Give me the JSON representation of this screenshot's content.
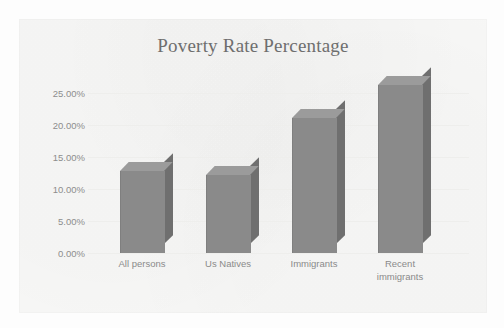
{
  "chart_data": {
    "type": "bar",
    "title": "Poverty Rate Percentage",
    "xlabel": "",
    "ylabel": "",
    "categories": [
      "All persons",
      "Us Natives",
      "Immigrants",
      "Recent immigrants"
    ],
    "values": [
      11.4,
      10.8,
      18.8,
      23.4
    ],
    "value_labels": [
      "11.40%",
      "10.80%",
      "18.80%",
      "23.40%"
    ],
    "ylim": [
      0,
      25
    ],
    "y_ticks": [
      0,
      5,
      10,
      15,
      20,
      25
    ],
    "y_tick_labels": [
      "0.00%",
      "5.00%",
      "10.00%",
      "15.00%",
      "20.00%",
      "25.00%"
    ],
    "grid": true,
    "legend": false,
    "legend_position": "none",
    "style": "3d-column",
    "series": [
      {
        "name": "Poverty Rate Percentage",
        "values": [
          11.4,
          10.8,
          18.8,
          23.4
        ]
      }
    ],
    "colors": {
      "bar_face": "#8a8a8a",
      "bar_top": "#9b9b9b",
      "bar_side": "#6f6f6f",
      "plot_background": "#f7f7f6",
      "gridline": "#eeeeec",
      "title_text": "#6e6e6e",
      "axis_text": "#8a8a8a"
    }
  },
  "category_label_lines": [
    [
      "All persons"
    ],
    [
      "Us Natives"
    ],
    [
      "Immigrants"
    ],
    [
      "Recent",
      "immigrants"
    ]
  ]
}
